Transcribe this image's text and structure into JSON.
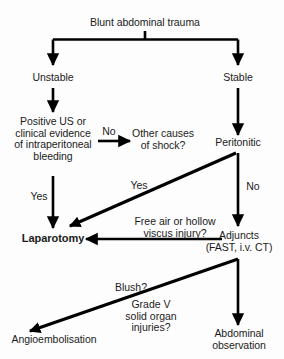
{
  "diagram": {
    "type": "flowchart",
    "background_color": "#fdfdfd",
    "line_color": "#000000",
    "text_color": "#1b1b1b",
    "nodes": [
      {
        "id": "root",
        "text": "Blunt abdominal trauma",
        "bold": false
      },
      {
        "id": "unstable",
        "text": "Unstable",
        "bold": false
      },
      {
        "id": "stable",
        "text": "Stable",
        "bold": false
      },
      {
        "id": "positive_us",
        "text": "Positive US or\nclinical evidence\nof intraperitoneal\nbleeding",
        "bold": false
      },
      {
        "id": "other_shock",
        "text": "Other causes\nof shock?",
        "bold": false
      },
      {
        "id": "peritonitic",
        "text": "Peritonitic",
        "bold": false
      },
      {
        "id": "laparotomy",
        "text": "Laparotomy",
        "bold": true
      },
      {
        "id": "adjuncts",
        "text": "Adjuncts\n(FAST, i.v. CT)",
        "bold": false
      },
      {
        "id": "angio",
        "text": "Angioembolisation",
        "bold": false
      },
      {
        "id": "abdo_obs",
        "text": "Abdominal\nobservation",
        "bold": false
      }
    ],
    "edge_labels": [
      {
        "id": "no_shock",
        "text": "No"
      },
      {
        "id": "yes_perit",
        "text": "Yes"
      },
      {
        "id": "no_perit",
        "text": "No"
      },
      {
        "id": "yes_bleeding",
        "text": "Yes"
      },
      {
        "id": "free_air",
        "text": "Free air or hollow\nviscus injury?"
      },
      {
        "id": "blush",
        "text": "Blush?"
      },
      {
        "id": "grade_v",
        "text": "Grade V\nsolid organ\ninjuries?"
      }
    ]
  }
}
